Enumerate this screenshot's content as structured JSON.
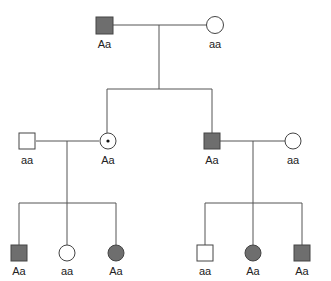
{
  "colors": {
    "affected": "#6e6e6e",
    "unaffected": "#ffffff",
    "line": "#555555"
  },
  "generations": {
    "g1": {
      "father": {
        "sex": "male",
        "status": "affected",
        "genotype": "Aa"
      },
      "mother": {
        "sex": "female",
        "status": "unaffected",
        "genotype": "aa"
      }
    },
    "g2": {
      "left_spouse": {
        "sex": "male",
        "status": "unaffected",
        "genotype": "aa"
      },
      "daughter": {
        "sex": "female",
        "status": "carrier",
        "genotype": "Aa"
      },
      "son": {
        "sex": "male",
        "status": "affected",
        "genotype": "Aa"
      },
      "right_spouse": {
        "sex": "female",
        "status": "unaffected",
        "genotype": "aa"
      }
    },
    "g3_left": [
      {
        "sex": "male",
        "status": "affected",
        "genotype": "Aa"
      },
      {
        "sex": "female",
        "status": "unaffected",
        "genotype": "aa"
      },
      {
        "sex": "female",
        "status": "affected",
        "genotype": "Aa"
      }
    ],
    "g3_right": [
      {
        "sex": "male",
        "status": "unaffected",
        "genotype": "aa"
      },
      {
        "sex": "female",
        "status": "affected",
        "genotype": "Aa"
      },
      {
        "sex": "male",
        "status": "affected",
        "genotype": "Aa"
      }
    ]
  }
}
